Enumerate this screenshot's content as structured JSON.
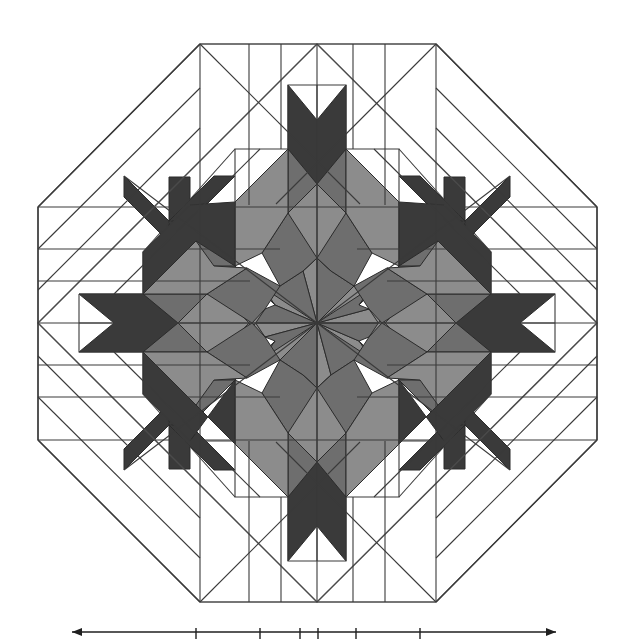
{
  "figure": {
    "kind": "line-drawing",
    "background_color": "#ffffff",
    "line_color": "#3a3a3a",
    "canvas": {
      "width": 628,
      "height": 639
    }
  },
  "palette": {
    "white": "#ffffff",
    "light_gray": "#8c8c8c",
    "medium_gray": "#6e6e6e",
    "dark_gray": "#3a3a3a",
    "outline": "#2b2b2b"
  },
  "geometry": {
    "center": {
      "x": 317,
      "y": 323
    },
    "octagon": {
      "label": "outer octagon frame",
      "top_edge_y": 44,
      "bottom_edge_y": 602,
      "left_edge_x": 38,
      "right_edge_x": 597,
      "top_left_vertex_x": 200,
      "top_right_vertex_x": 436,
      "vertices": [
        {
          "x": 200,
          "y": 44
        },
        {
          "x": 436,
          "y": 44
        },
        {
          "x": 597,
          "y": 207
        },
        {
          "x": 597,
          "y": 440
        },
        {
          "x": 436,
          "y": 602
        },
        {
          "x": 200,
          "y": 602
        },
        {
          "x": 38,
          "y": 440
        },
        {
          "x": 38,
          "y": 207
        }
      ],
      "side_count": 8
    },
    "inner_square": {
      "label": "inscribed rotated square",
      "vertices": [
        {
          "x": 317,
          "y": 44
        },
        {
          "x": 597,
          "y": 323
        },
        {
          "x": 317,
          "y": 602
        },
        {
          "x": 38,
          "y": 323
        }
      ]
    },
    "star": {
      "label": "sixteen-point compass star",
      "point_count": 16,
      "major_points": 8,
      "minor_points": 8,
      "ring_count": 4,
      "ring_radii": [
        52,
        104,
        156,
        208
      ],
      "major_point_radius": 208,
      "minor_point_radius": 156,
      "notch_depth": 0.42
    },
    "ring_bands": {
      "label": "concentric chevron bands",
      "band_radii": [
        52,
        104,
        156,
        208,
        260
      ],
      "shading": [
        "light_gray",
        "medium_gray",
        "dark_gray",
        "white"
      ]
    }
  },
  "scale_bar": {
    "label": "scale bar (cropped figure below)",
    "visible": true,
    "y": 632,
    "x_start": 72,
    "x_end": 556,
    "tick_positions": [
      72,
      196,
      260,
      300,
      318,
      356,
      420,
      556
    ],
    "arrow_ends": true
  }
}
